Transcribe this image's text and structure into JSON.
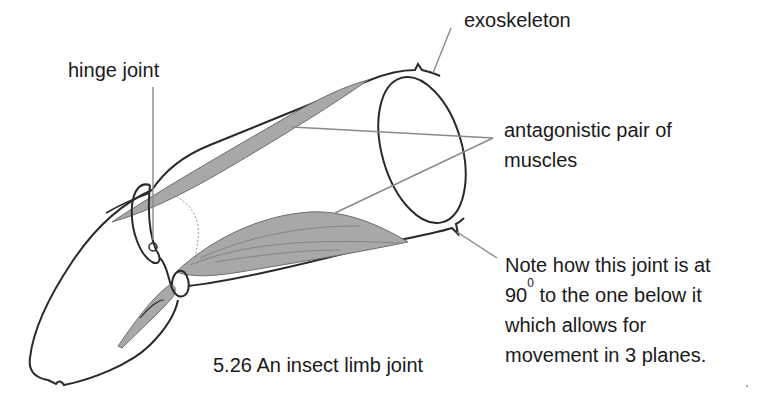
{
  "figure": {
    "caption": "5.26 An insect limb joint"
  },
  "labels": {
    "hinge_joint": "hinge joint",
    "exoskeleton": "exoskeleton",
    "antagonistic": {
      "line1": "antagonistic pair of",
      "line2": "muscles"
    },
    "note": {
      "line1": "Note how this joint is at",
      "line2_prefix": "90",
      "line2_sup": "0",
      "line2_suffix": " to the one below it",
      "line3": "which allows for",
      "line4": "movement in 3 planes."
    }
  },
  "colors": {
    "outline": "#2a2a2a",
    "leader": "#8a8a8a",
    "muscle_fill": "#a8a8a8",
    "muscle_stroke": "#6e6e6e"
  }
}
